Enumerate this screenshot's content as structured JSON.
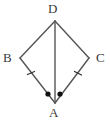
{
  "figure": {
    "type": "geometry-diagram",
    "shape_name": "kite",
    "canvas": {
      "width": 110,
      "height": 121
    },
    "stroke_color": "#555555",
    "mark_color": "#1a1a1a",
    "label_color": "#3b3b3b",
    "background_color": "#ffffff",
    "vertices": [
      {
        "id": "D",
        "label": "D",
        "x": 55,
        "y": 21,
        "label_x": 48,
        "label_y": 2
      },
      {
        "id": "B",
        "label": "B",
        "x": 20,
        "y": 58,
        "label_x": 3,
        "label_y": 51
      },
      {
        "id": "C",
        "label": "C",
        "x": 89,
        "y": 58,
        "label_x": 96,
        "label_y": 51
      },
      {
        "id": "A",
        "label": "A",
        "x": 55,
        "y": 103,
        "label_x": 49,
        "label_y": 106
      }
    ],
    "edges": [
      {
        "id": "DB",
        "from": "D",
        "to": "B"
      },
      {
        "id": "DC",
        "from": "D",
        "to": "C"
      },
      {
        "id": "BA",
        "from": "B",
        "to": "A"
      },
      {
        "id": "CA",
        "from": "C",
        "to": "A"
      }
    ],
    "diagonal": {
      "id": "DA",
      "from": "D",
      "to": "A"
    },
    "tick_marks": [
      {
        "id": "tick-BA",
        "on_edge": "BA",
        "x": 31,
        "y": 73,
        "count": 1
      },
      {
        "id": "tick-CA",
        "on_edge": "CA",
        "x": 78,
        "y": 74,
        "count": 1
      }
    ],
    "angle_dots": [
      {
        "id": "angle-dot-BAD",
        "at_vertex": "A",
        "x": 48,
        "y": 94,
        "radius": 2.6
      },
      {
        "id": "angle-dot-DAC",
        "at_vertex": "A",
        "x": 60,
        "y": 94,
        "radius": 2.6
      }
    ]
  }
}
